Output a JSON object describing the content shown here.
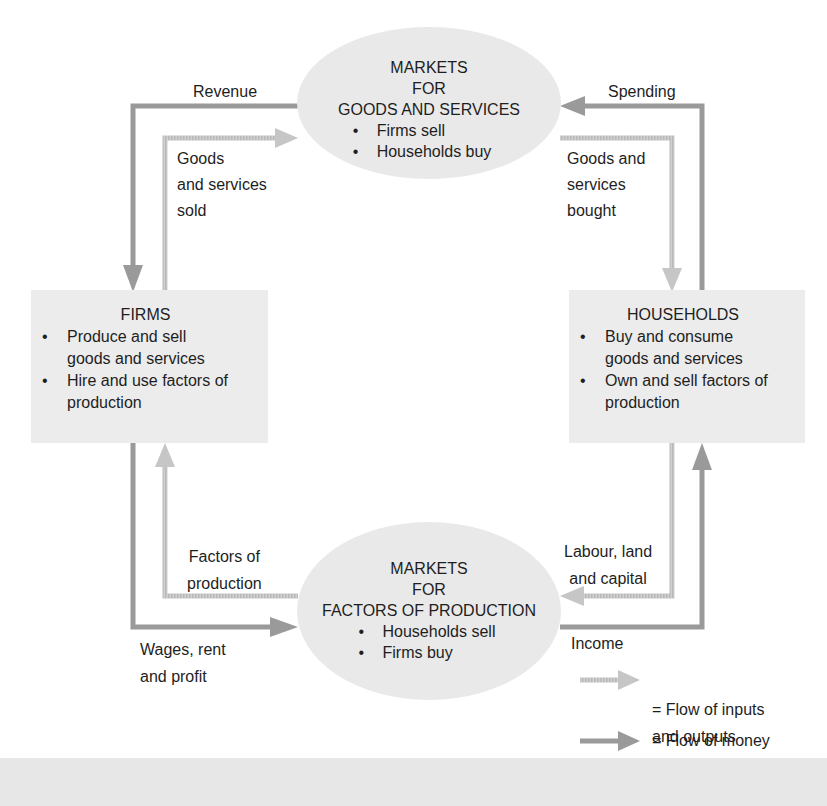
{
  "diagram": {
    "type": "circular-flow",
    "colors": {
      "money_flow": "#9a9a9a",
      "goods_flow": "#c6c6c6",
      "box_fill": "#ececec",
      "ellipse_fill": "#e9e9e9",
      "text": "#1e1e1e"
    },
    "goods_market": {
      "title_line1": "MARKETS",
      "title_line2": "FOR",
      "title_line3": "GOODS AND SERVICES",
      "bullets": [
        "Firms sell",
        "Households buy"
      ]
    },
    "factor_market": {
      "title_line1": "MARKETS",
      "title_line2": "FOR",
      "title_line3": "FACTORS OF PRODUCTION",
      "bullets": [
        "Households sell",
        "Firms buy"
      ]
    },
    "firms": {
      "title": "FIRMS",
      "bullets": [
        "Produce and sell goods and services",
        "Hire and use factors of production"
      ]
    },
    "households": {
      "title": "HOUSEHOLDS",
      "bullets": [
        "Buy and consume goods and services",
        "Own and sell factors of production"
      ]
    },
    "flow_labels": {
      "revenue": "Revenue",
      "goods_sold": "Goods\nand services\nsold",
      "spending": "Spending",
      "goods_bought": "Goods and\nservices\nbought",
      "factors_of_production": "Factors of\nproduction",
      "wages_rent_profit": "Wages, rent\nand profit",
      "labour_land_capital": "Labour, land\nand capital",
      "income": "Income"
    },
    "legend": {
      "inputs_outputs": "= Flow of inputs\nand outputs",
      "money": "= Flow of money"
    }
  }
}
